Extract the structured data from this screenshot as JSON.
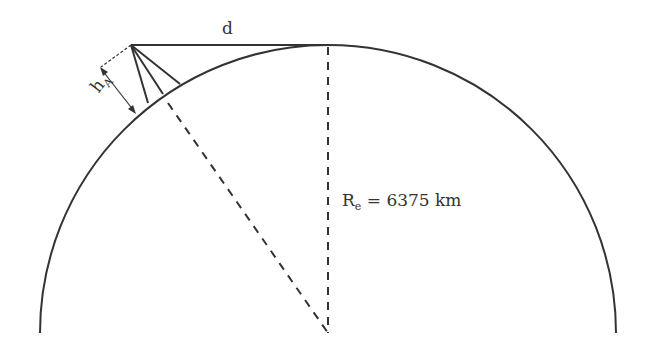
{
  "labels": {
    "distance": "d",
    "height_main": "h",
    "height_sub": "A",
    "radius_main": "R",
    "radius_sub": "e",
    "radius_value": " = 6375 km"
  },
  "colors": {
    "stroke": "#333333",
    "background": "#ffffff"
  }
}
